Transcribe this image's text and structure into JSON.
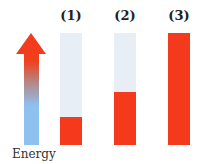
{
  "arrow": {
    "label": "Energy",
    "color_top": "#f5391c",
    "color_bottom": "#8ec0f0"
  },
  "bars": [
    {
      "label": "(1)",
      "fill_fraction": 0.25
    },
    {
      "label": "(2)",
      "fill_fraction": 0.47
    },
    {
      "label": "(3)",
      "fill_fraction": 1.0
    }
  ],
  "colors": {
    "fill": "#f5391c",
    "empty": "#e8eef6"
  }
}
